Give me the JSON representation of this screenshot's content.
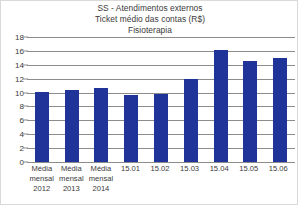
{
  "chart_data": {
    "type": "bar",
    "title": "SS - Atendimentos externos",
    "subtitle": "Ticket médio das contas (R$)",
    "subtitle2": "Fisioterapia",
    "title_lines": [
      "SS - Atendimentos externos",
      "Ticket médio das contas (R$)",
      "Fisioterapia"
    ],
    "xlabel": "",
    "ylabel": "",
    "ylim": [
      0,
      18
    ],
    "ytick_step": 2,
    "yticks": [
      18,
      16,
      14,
      12,
      10,
      8,
      6,
      4,
      2,
      0
    ],
    "ytick_labels": [
      "18",
      "16",
      "14",
      "12",
      "10",
      "8",
      "6",
      "4",
      "2",
      "0"
    ],
    "grid": true,
    "legend": false,
    "legend_position": "none",
    "categories": [
      "Média mensal 2012",
      "Média mensal 2013",
      "Média mensal 2014",
      "15.01",
      "15.02",
      "15.03",
      "15.04",
      "15.05",
      "15.06"
    ],
    "category_lines": [
      [
        "Média",
        "mensal",
        "2012"
      ],
      [
        "Média",
        "mensal",
        "2013"
      ],
      [
        "Média",
        "mensal",
        "2014"
      ],
      [
        "15.01"
      ],
      [
        "15.02"
      ],
      [
        "15.03"
      ],
      [
        "15.04"
      ],
      [
        "15.05"
      ],
      [
        "15.06"
      ]
    ],
    "values": [
      10.1,
      10.4,
      10.7,
      9.7,
      9.8,
      12.0,
      16.1,
      14.6,
      15.0
    ],
    "bar_color": "#1f3399",
    "gridline_color": "#8c8c8c",
    "text_color": "#3a3a3a",
    "background_color": "#ffffff",
    "border_color": "#d9d9d9"
  }
}
